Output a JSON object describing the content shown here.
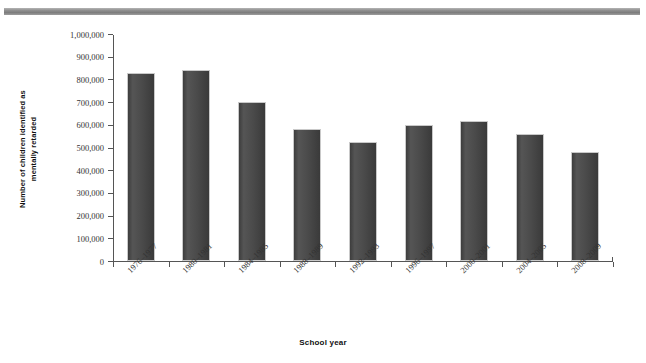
{
  "chart_data": {
    "type": "bar",
    "title": "",
    "subtitle": "",
    "xlabel": "School year",
    "ylabel_line1": "Number of children identified as",
    "ylabel_line2": "mentally retarded",
    "categories": [
      "1976–1977",
      "1980–1981",
      "1984–1985",
      "1988–1989",
      "1992–1993",
      "1996–1997",
      "2000–2001",
      "2004–2005",
      "2008–2009"
    ],
    "values": [
      828000,
      843000,
      700000,
      580000,
      525000,
      600000,
      615000,
      560000,
      478000
    ],
    "ylim": [
      0,
      1000000
    ],
    "ytick_values": [
      0,
      100000,
      200000,
      300000,
      400000,
      500000,
      600000,
      700000,
      800000,
      900000,
      1000000
    ],
    "ytick_labels": [
      "0",
      "100,000",
      "200,000",
      "300,000",
      "400,000",
      "500,000",
      "600,000",
      "700,000",
      "800,000",
      "900,000",
      "1,000,000"
    ],
    "grid": false,
    "legend": null,
    "series_name": "Number of children identified as mentally retarded",
    "bar_color": "#4a4a4a",
    "axis_color": "#555555",
    "background_color": "#ffffff"
  },
  "decor": {
    "top_rule_color": "#8f8f8f"
  }
}
